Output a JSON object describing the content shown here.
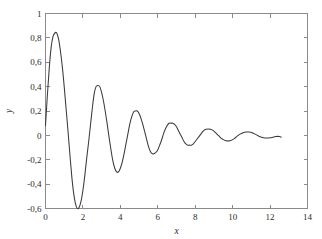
{
  "figure": {
    "background_color": "#ffffff",
    "frame_color": "#8a8a8a",
    "curve_color": "#3a3a3a"
  },
  "axis": {
    "x_title": "x",
    "y_title": "y",
    "x_ticks": [
      "0",
      "2",
      "4",
      "6",
      "8",
      "10",
      "12",
      "14"
    ],
    "x_tick_values": [
      0,
      2,
      4,
      6,
      8,
      10,
      12,
      14
    ],
    "y_ticks": [
      "-0,6",
      "-0,4",
      "-0,2",
      "0",
      "0,2",
      "0,4",
      "0,6",
      "0,8",
      "1"
    ],
    "y_tick_values": [
      -0.6,
      -0.4,
      -0.2,
      0,
      0.2,
      0.4,
      0.6,
      0.8,
      1
    ]
  },
  "chart_data": {
    "type": "line",
    "title": "",
    "subtitle": "",
    "xlabel": "x",
    "ylabel": "y",
    "xlim": [
      0,
      14
    ],
    "ylim": [
      -0.6,
      1
    ],
    "grid": false,
    "legend": null,
    "annotations": [],
    "series": [
      {
        "name": "damped oscillation",
        "color": "#3a3a3a",
        "x": [
          0.0,
          0.1,
          0.2,
          0.3,
          0.4,
          0.5,
          0.6,
          0.7,
          0.8,
          0.9,
          1.0,
          1.1,
          1.2,
          1.3,
          1.4,
          1.5,
          1.6,
          1.7,
          1.8,
          1.9,
          2.0,
          2.1,
          2.2,
          2.3,
          2.4,
          2.5,
          2.6,
          2.7,
          2.8,
          2.9,
          3.0,
          3.1,
          3.2,
          3.3,
          3.4,
          3.5,
          3.6,
          3.7,
          3.8,
          3.9,
          4.0,
          4.1,
          4.2,
          4.3,
          4.4,
          4.5,
          4.6,
          4.7,
          4.8,
          4.9,
          5.0,
          5.1,
          5.2,
          5.3,
          5.4,
          5.5,
          5.6,
          5.7,
          5.8,
          5.9,
          6.0,
          6.1,
          6.2,
          6.3,
          6.4,
          6.5,
          6.6,
          6.7,
          6.8,
          6.9,
          7.0,
          7.1,
          7.2,
          7.3,
          7.4,
          7.5,
          7.6,
          7.7,
          7.8,
          7.9,
          8.0,
          8.1,
          8.2,
          8.3,
          8.4,
          8.5,
          8.6,
          8.7,
          8.8,
          8.9,
          9.0,
          9.1,
          9.2,
          9.3,
          9.4,
          9.5,
          9.6,
          9.7,
          9.8,
          9.9,
          10.0,
          10.1,
          10.2,
          10.3,
          10.4,
          10.5,
          10.6,
          10.7,
          10.8,
          10.9,
          11.0,
          11.1,
          11.2,
          11.3,
          11.4,
          11.5,
          11.6,
          11.7,
          11.8,
          11.9,
          12.0,
          12.1,
          12.2,
          12.3,
          12.4,
          12.5,
          12.6
        ],
        "y": [
          0.08,
          0.33,
          0.55,
          0.72,
          0.81,
          0.84,
          0.84,
          0.79,
          0.69,
          0.56,
          0.4,
          0.22,
          0.04,
          -0.15,
          -0.33,
          -0.47,
          -0.56,
          -0.6,
          -0.59,
          -0.54,
          -0.45,
          -0.33,
          -0.19,
          -0.06,
          0.08,
          0.22,
          0.34,
          0.4,
          0.41,
          0.4,
          0.35,
          0.28,
          0.19,
          0.09,
          -0.02,
          -0.12,
          -0.21,
          -0.27,
          -0.3,
          -0.3,
          -0.27,
          -0.22,
          -0.15,
          -0.07,
          0.01,
          0.09,
          0.15,
          0.19,
          0.2,
          0.2,
          0.18,
          0.14,
          0.09,
          0.03,
          -0.03,
          -0.09,
          -0.13,
          -0.15,
          -0.15,
          -0.14,
          -0.12,
          -0.08,
          -0.04,
          0.01,
          0.05,
          0.08,
          0.1,
          0.1,
          0.1,
          0.09,
          0.07,
          0.04,
          0.01,
          -0.02,
          -0.05,
          -0.07,
          -0.08,
          -0.08,
          -0.08,
          -0.07,
          -0.05,
          -0.03,
          -0.01,
          0.01,
          0.03,
          0.045,
          0.05,
          0.052,
          0.05,
          0.045,
          0.035,
          0.02,
          0.005,
          -0.01,
          -0.025,
          -0.035,
          -0.042,
          -0.045,
          -0.045,
          -0.042,
          -0.035,
          -0.025,
          -0.012,
          0.0,
          0.01,
          0.018,
          0.024,
          0.027,
          0.028,
          0.027,
          0.024,
          0.018,
          0.01,
          0.002,
          -0.006,
          -0.013,
          -0.018,
          -0.021,
          -0.022,
          -0.022,
          -0.02,
          -0.017,
          -0.013,
          -0.01,
          -0.008,
          -0.01,
          -0.015
        ]
      }
    ]
  }
}
